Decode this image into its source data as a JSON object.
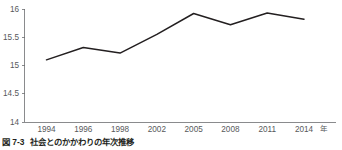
{
  "caption": {
    "number": "図 7-3",
    "text": "社会とのかかわりの年次推移"
  },
  "chart_data": {
    "type": "line",
    "title": "社会とのかかわりの年次推移",
    "xlabel": "年",
    "ylabel": "",
    "categories": [
      "1994",
      "1996",
      "1998",
      "2002",
      "2005",
      "2008",
      "2011",
      "2014"
    ],
    "x": [
      1994,
      1996,
      1998,
      2002,
      2005,
      2008,
      2011,
      2014
    ],
    "values": [
      15.1,
      15.32,
      15.22,
      15.55,
      15.92,
      15.72,
      15.93,
      15.82
    ],
    "series": [
      {
        "name": "社会とのかかわり",
        "values": [
          15.1,
          15.32,
          15.22,
          15.55,
          15.92,
          15.72,
          15.93,
          15.82
        ],
        "color": "#231f20"
      }
    ],
    "ylim": [
      14,
      16
    ],
    "yticks": [
      14,
      14.5,
      15,
      15.5,
      16
    ],
    "ytick_labels": [
      "14",
      "14.5",
      "15",
      "15.5",
      "16"
    ],
    "xtick_labels": [
      "1994",
      "1996",
      "1998",
      "2002",
      "2005",
      "2008",
      "2011",
      "2014"
    ],
    "x_unit_suffix": "年",
    "grid": false,
    "legend": false,
    "axis_color": "#6d6e71",
    "line_color": "#231f20"
  }
}
